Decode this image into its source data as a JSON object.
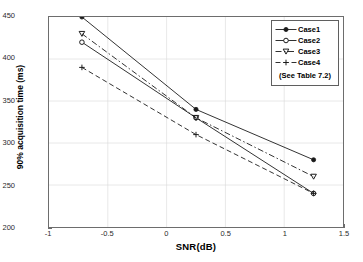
{
  "chart_data": {
    "type": "line",
    "title": "",
    "xlabel": "SNR(dB)",
    "ylabel": "90% acquisition time (ms)",
    "xlim": [
      -1,
      1.5
    ],
    "ylim": [
      200,
      450
    ],
    "xticks": [
      "-1",
      "-0.5",
      "0",
      "0.5",
      "1",
      "1.5"
    ],
    "xtick_values": [
      -1,
      -0.5,
      0,
      0.5,
      1,
      1.5
    ],
    "yticks": [
      "200",
      "250",
      "300",
      "350",
      "400",
      "450"
    ],
    "ytick_values": [
      200,
      250,
      300,
      350,
      400,
      450
    ],
    "grid": true,
    "legend_position": "top-right",
    "legend_note": "(See Table 7.2)",
    "x": [
      -0.72,
      0.25,
      1.25
    ],
    "series": [
      {
        "name": "Case1",
        "values": [
          450,
          340,
          280
        ],
        "style": "solid",
        "marker": "filled-dot"
      },
      {
        "name": "Case2",
        "values": [
          420,
          330,
          240
        ],
        "style": "solid",
        "marker": "open-circle"
      },
      {
        "name": "Case3",
        "values": [
          430,
          330,
          260
        ],
        "style": "dashdot",
        "marker": "triangle-down"
      },
      {
        "name": "Case4",
        "values": [
          390,
          310,
          240
        ],
        "style": "dashed",
        "marker": "plus"
      }
    ]
  },
  "colors": {
    "axis": "#6d6d6d",
    "grid": "#d8d8d8",
    "series": "#1a1a1a",
    "background": "#ffffff"
  }
}
